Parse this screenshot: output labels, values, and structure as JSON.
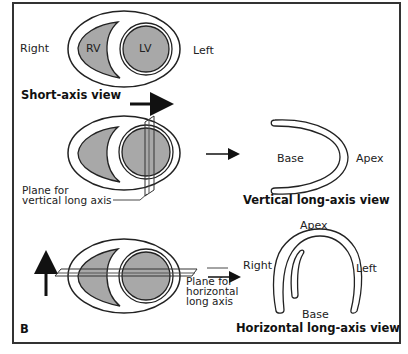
{
  "figure": {
    "panel_label": "B",
    "colors": {
      "myocardium_fill": "#a8a8a8",
      "outline": "#222222",
      "background": "#ffffff"
    }
  },
  "short_axis": {
    "left_label": "Right",
    "right_label": "Left",
    "rv_label": "RV",
    "lv_label": "LV",
    "caption": "Short-axis view"
  },
  "vertical": {
    "plane_label_line1": "Plane for",
    "plane_label_line2": "vertical long axis",
    "base_label": "Base",
    "apex_label": "Apex",
    "caption": "Vertical long-axis view"
  },
  "horizontal": {
    "plane_label_line1": "Plane for",
    "plane_label_line2": "horizontal",
    "plane_label_line3": "long axis",
    "apex_label": "Apex",
    "right_label": "Right",
    "left_label": "Left",
    "base_label": "Base",
    "caption": "Horizontal long-axis view"
  }
}
